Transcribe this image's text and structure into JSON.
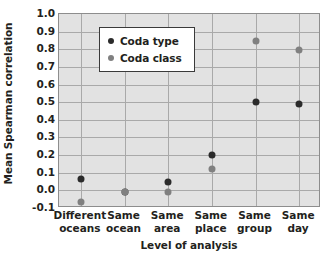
{
  "chart_data": {
    "type": "scatter",
    "title": "",
    "xlabel": "Level of analysis",
    "ylabel": "Mean Spearman correlation",
    "categories": [
      "Different oceans",
      "Same ocean",
      "Same area",
      "Same place",
      "Same group",
      "Same day"
    ],
    "category_lines": [
      [
        "Different",
        "oceans"
      ],
      [
        "Same",
        "ocean"
      ],
      [
        "Same",
        "area"
      ],
      [
        "Same",
        "place"
      ],
      [
        "Same",
        "group"
      ],
      [
        "Same",
        "day"
      ]
    ],
    "ylim": [
      -0.1,
      1.0
    ],
    "yticks": [
      1.0,
      0.9,
      0.8,
      0.7,
      0.6,
      0.5,
      0.4,
      0.3,
      0.2,
      0.1,
      0.0,
      -0.1
    ],
    "ytick_labels": [
      "1.0",
      "0.9",
      "0.8",
      "0.7",
      "0.6",
      "0.5",
      "0.4",
      "0.3",
      "0.2",
      "0.1",
      "0.0",
      "-0.1"
    ],
    "grid": true,
    "grid_color": "#a9a9a9",
    "plot_background": "#e2e2e2",
    "legend_position": "upper left inside",
    "series": [
      {
        "name": "Coda type",
        "color": "#2b2b2b",
        "values": [
          0.065,
          -0.012,
          0.05,
          0.2,
          0.5,
          0.49
        ]
      },
      {
        "name": "Coda class",
        "color": "#808080",
        "values": [
          -0.065,
          -0.012,
          -0.012,
          0.12,
          0.845,
          0.795
        ]
      }
    ]
  },
  "legend": {
    "entries": [
      {
        "label": "Coda type",
        "swatch": "legend-dot-coda-type"
      },
      {
        "label": "Coda class",
        "swatch": "legend-dot-coda-class"
      }
    ]
  }
}
